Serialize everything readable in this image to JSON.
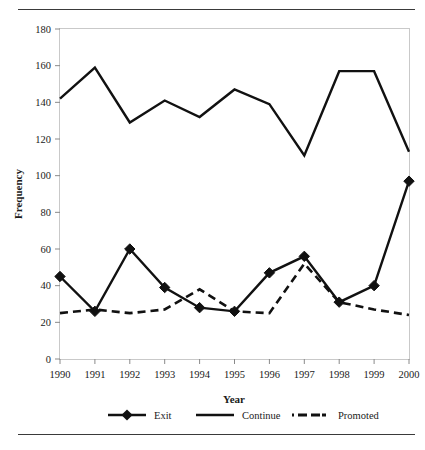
{
  "chart_data": {
    "type": "line",
    "title": "",
    "xlabel": "Year",
    "ylabel": "Frequency",
    "x": [
      1990,
      1991,
      1992,
      1993,
      1994,
      1995,
      1996,
      1997,
      1998,
      1999,
      2000
    ],
    "categories": [
      "1990",
      "1991",
      "1992",
      "1993",
      "1994",
      "1995",
      "1996",
      "1997",
      "1998",
      "1999",
      "2000"
    ],
    "xlim": [
      1990,
      2000
    ],
    "ylim": [
      0,
      180
    ],
    "yticks": [
      0,
      20,
      40,
      60,
      80,
      100,
      120,
      140,
      160,
      180
    ],
    "ytick_labels": [
      "0",
      "20",
      "40",
      "60",
      "80",
      "100",
      "120",
      "140",
      "160",
      "180"
    ],
    "grid": false,
    "legend_position": "bottom",
    "series": [
      {
        "name": "Exit",
        "style": "solid-with-diamond-markers",
        "color": "#111111",
        "marker": "diamond",
        "values": [
          45,
          26,
          60,
          39,
          28,
          26,
          47,
          56,
          31,
          40,
          97
        ]
      },
      {
        "name": "Continue",
        "style": "solid",
        "color": "#111111",
        "marker": "none",
        "values": [
          142,
          159,
          129,
          141,
          132,
          147,
          139,
          111,
          157,
          157,
          113
        ]
      },
      {
        "name": "Promoted",
        "style": "dashed",
        "color": "#111111",
        "marker": "none",
        "values": [
          25,
          27,
          25,
          27,
          38,
          26,
          25,
          52,
          31,
          27,
          24
        ]
      }
    ]
  },
  "legend": {
    "items": [
      {
        "label": "Exit",
        "style": "solid-with-diamond-markers"
      },
      {
        "label": "Continue",
        "style": "solid"
      },
      {
        "label": "Promoted",
        "style": "dashed"
      }
    ]
  },
  "axes": {
    "x_title": "Year",
    "y_title": "Frequency"
  }
}
